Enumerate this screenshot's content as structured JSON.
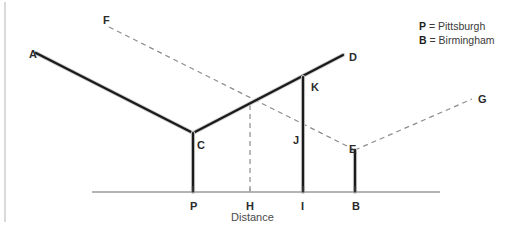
{
  "figure": {
    "width": 523,
    "height": 228,
    "background": "#ffffff",
    "axis_label": "Distance",
    "solid_color": "#1a1a1a",
    "dashed_color": "#8c8c8c",
    "axis_color": "#9b9b9b",
    "border_color": "#b5b5b5"
  },
  "legend": {
    "entries": [
      {
        "key": "P",
        "eq": "=",
        "name": "Pittsburgh"
      },
      {
        "key": "B",
        "eq": "=",
        "name": "Birmingham"
      }
    ]
  },
  "points": [
    {
      "id": "A",
      "label": "A",
      "x": 29,
      "y": 49,
      "node_x": 36,
      "node_y": 53
    },
    {
      "id": "F",
      "label": "F",
      "x": 103,
      "y": 15,
      "node_x": 109,
      "node_y": 27
    },
    {
      "id": "D",
      "label": "D",
      "x": 349,
      "y": 52,
      "node_x": 343,
      "node_y": 55
    },
    {
      "id": "K",
      "label": "K",
      "x": 311,
      "y": 82,
      "node_x": 303,
      "node_y": 77
    },
    {
      "id": "G",
      "label": "G",
      "x": 478,
      "y": 94,
      "node_x": 472,
      "node_y": 99
    },
    {
      "id": "C",
      "label": "C",
      "x": 197,
      "y": 140,
      "node_x": 193,
      "node_y": 133
    },
    {
      "id": "J",
      "label": "J",
      "x": 293,
      "y": 135,
      "node_x": 303,
      "node_y": 131
    },
    {
      "id": "E",
      "label": "E",
      "x": 349,
      "y": 144,
      "node_x": 355,
      "node_y": 150
    },
    {
      "id": "P",
      "label": "P",
      "x": 190,
      "y": 201,
      "node_x": 193,
      "node_y": 192
    },
    {
      "id": "H",
      "label": "H",
      "x": 246,
      "y": 201,
      "node_x": 250,
      "node_y": 192
    },
    {
      "id": "I",
      "label": "I",
      "x": 301,
      "y": 201,
      "node_x": 303,
      "node_y": 192
    },
    {
      "id": "B",
      "label": "B",
      "x": 352,
      "y": 201,
      "node_x": 355,
      "node_y": 192
    }
  ],
  "segments": {
    "solid": [
      {
        "name": "segment-a-c",
        "x1": 36,
        "y1": 53,
        "x2": 193,
        "y2": 133
      },
      {
        "name": "segment-c-d",
        "x1": 193,
        "y1": 133,
        "x2": 343,
        "y2": 55
      },
      {
        "name": "segment-c-p",
        "x1": 193,
        "y1": 133,
        "x2": 193,
        "y2": 192
      },
      {
        "name": "segment-k-i",
        "x1": 303,
        "y1": 77,
        "x2": 303,
        "y2": 192
      },
      {
        "name": "segment-e-b",
        "x1": 355,
        "y1": 150,
        "x2": 355,
        "y2": 192
      }
    ],
    "dashed": [
      {
        "name": "segment-f-e",
        "x1": 109,
        "y1": 27,
        "x2": 355,
        "y2": 150
      },
      {
        "name": "segment-e-g",
        "x1": 355,
        "y1": 150,
        "x2": 472,
        "y2": 99
      },
      {
        "name": "segment-h-vertical",
        "x1": 250,
        "y1": 105,
        "x2": 250,
        "y2": 192
      }
    ]
  },
  "axis": {
    "name": "distance-axis",
    "x1": 92,
    "y": 192,
    "x2": 440,
    "ticks": [
      {
        "label": "P",
        "x": 193,
        "bold": true
      },
      {
        "label": "H",
        "x": 250,
        "bold": false
      },
      {
        "label": "I",
        "x": 303,
        "bold": true
      },
      {
        "label": "B",
        "x": 355,
        "bold": true
      }
    ],
    "title": "Distance",
    "title_x": 231,
    "title_y": 211
  },
  "border": {
    "left_x": 5,
    "top_y": 2,
    "bottom_y": 222
  }
}
